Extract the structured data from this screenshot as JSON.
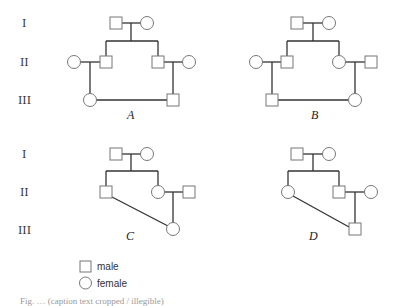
{
  "generation_labels_top": [
    "I",
    "II",
    "III"
  ],
  "generation_labels_bottom": [
    "I",
    "II",
    "III"
  ],
  "panels": [
    {
      "label": "A",
      "description": "first cousin marriage: female III (daughter of II male) married to male III (son of II male)"
    },
    {
      "label": "B",
      "description": "first cousin marriage: male III (son of II male) married to female III (daughter of II female)"
    },
    {
      "label": "C",
      "description": "uncle-niece mating: II male with III female (daughter of his sister)"
    },
    {
      "label": "D",
      "description": "aunt-nephew mating: II female with III male (son of her brother)"
    }
  ],
  "legend": {
    "male": "male",
    "female": "female"
  },
  "caption": "Fig. … (caption text cropped / illegible)"
}
